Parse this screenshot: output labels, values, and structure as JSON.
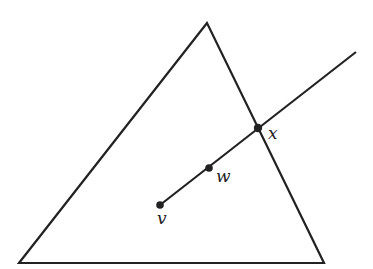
{
  "diagram": {
    "triangle": {
      "apex": [
        207,
        23
      ],
      "bottom_left": [
        19,
        263
      ],
      "bottom_right": [
        324,
        263
      ]
    },
    "ray": {
      "start": [
        160,
        205
      ],
      "end": [
        356,
        52
      ]
    },
    "points": [
      {
        "name": "v",
        "label": "v",
        "pos": [
          160,
          205
        ],
        "label_pos": [
          161,
          224
        ]
      },
      {
        "name": "w",
        "label": "w",
        "pos": [
          209,
          168
        ],
        "label_pos": [
          218,
          181
        ]
      },
      {
        "name": "x",
        "label": "x",
        "pos": [
          258,
          128
        ],
        "label_pos": [
          270,
          138
        ]
      }
    ],
    "stroke_color": "#222222"
  }
}
